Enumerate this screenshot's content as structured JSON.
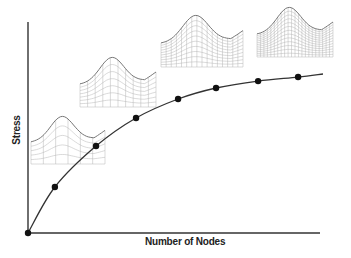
{
  "chart_data": {
    "type": "line",
    "title": "",
    "xlabel": "Number of Nodes",
    "ylabel": "Stress",
    "xlim": [
      0,
      100
    ],
    "ylim": [
      0,
      100
    ],
    "grid": false,
    "legend": null,
    "tick_labels": {
      "x": [],
      "y": []
    },
    "series": [
      {
        "name": "Stress vs. Number of Nodes (mesh convergence)",
        "marker": "filled-circle",
        "color": "#222222",
        "x": [
          0,
          9.2,
          23.3,
          37.0,
          51.4,
          64.4,
          78.8,
          92.5
        ],
        "y": [
          0,
          21.8,
          41.2,
          54.5,
          63.5,
          68.7,
          72.0,
          73.9
        ]
      }
    ],
    "annotations": [
      {
        "type": "mesh-inset",
        "description": "coarse mesh of curved part",
        "density": 6,
        "near_point_index": 2
      },
      {
        "type": "mesh-inset",
        "description": "medium mesh of curved part",
        "density": 10,
        "near_point_index": 3
      },
      {
        "type": "mesh-inset",
        "description": "fine mesh of curved part",
        "density": 16,
        "near_point_index": 5
      },
      {
        "type": "mesh-inset",
        "description": "very fine mesh of curved part",
        "density": 22,
        "near_point_index": 7
      }
    ]
  },
  "axes": {
    "x_label": "Number of Nodes",
    "y_label": "Stress"
  },
  "pixel_layout": {
    "origin": [
      28,
      233
    ],
    "x_axis_end": 320,
    "y_axis_top": 22,
    "x_scale_px": 292,
    "y_scale_px": 211,
    "curve_end": [
      323,
      74
    ],
    "insets": [
      {
        "x": 31,
        "y": 116,
        "w": 74,
        "h": 48,
        "cols": 6,
        "rows": 5
      },
      {
        "x": 80,
        "y": 57,
        "w": 76,
        "h": 50,
        "cols": 10,
        "rows": 7
      },
      {
        "x": 161,
        "y": 15,
        "w": 82,
        "h": 52,
        "cols": 16,
        "rows": 10
      },
      {
        "x": 257,
        "y": 7,
        "w": 76,
        "h": 50,
        "cols": 22,
        "rows": 13
      }
    ]
  },
  "colors": {
    "axis": "#333333",
    "curve": "#333333",
    "marker": "#111111",
    "mesh": "#b5b5b5",
    "mesh_outline": "#777777"
  }
}
